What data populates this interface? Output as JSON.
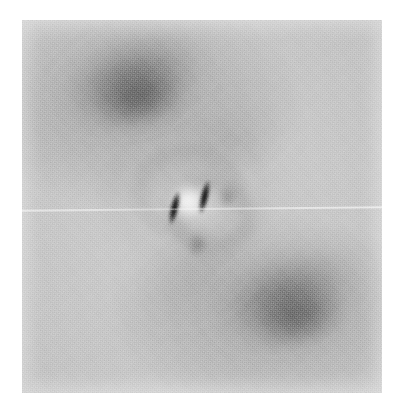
{
  "figure": {
    "title": "Lorentz transmission electron micrograph",
    "modality": "grayscale-micrograph",
    "caption": "",
    "image_width": 404,
    "image_height": 414,
    "plate": {
      "x": 22,
      "y": 20,
      "width": 360,
      "height": 373,
      "background_color": "#c6c6c6",
      "margin_color": "#ffffff"
    }
  },
  "palette": {
    "margin_white": "#ffffff",
    "plate_mid_gray": "#c6c6c6",
    "lobe_dark_gray": "#4a4a4a",
    "streak_black": "#0a0a0a",
    "core_white": "#ffffff",
    "scanline_white": "#ffffff"
  },
  "features": [
    {
      "name": "upper-left-dark-lobe",
      "kind": "diffuse-lobe",
      "center_x": 133,
      "center_y": 80,
      "width": 150,
      "height": 76,
      "rotation_deg": -18,
      "tone": "dark"
    },
    {
      "name": "lower-right-dark-lobe",
      "kind": "diffuse-lobe",
      "center_x": 287,
      "center_y": 296,
      "width": 150,
      "height": 76,
      "rotation_deg": -18,
      "tone": "dark"
    },
    {
      "name": "central-bright-core",
      "kind": "bright-spot",
      "center_x": 188,
      "center_y": 201,
      "width": 44,
      "height": 42,
      "tone": "bright"
    },
    {
      "name": "left-dark-streak",
      "kind": "streak",
      "center_x": 174,
      "center_y": 208,
      "length": 36,
      "thickness": 9,
      "rotation_deg": 13,
      "tone": "black"
    },
    {
      "name": "right-dark-streak",
      "kind": "streak",
      "center_x": 204,
      "center_y": 197,
      "length": 36,
      "thickness": 9,
      "rotation_deg": 13,
      "tone": "black"
    },
    {
      "name": "fresnel-halo-ring",
      "kind": "ring",
      "center_x": 188,
      "center_y": 192,
      "outer_width": 164,
      "outer_height": 140,
      "tone": "faint"
    },
    {
      "name": "horizontal-scanline-artifact",
      "kind": "line",
      "y": 208,
      "rotation_deg": -0.55,
      "tone": "bright"
    }
  ],
  "annotations": {
    "scale_bar": "",
    "label": "",
    "units": ""
  }
}
